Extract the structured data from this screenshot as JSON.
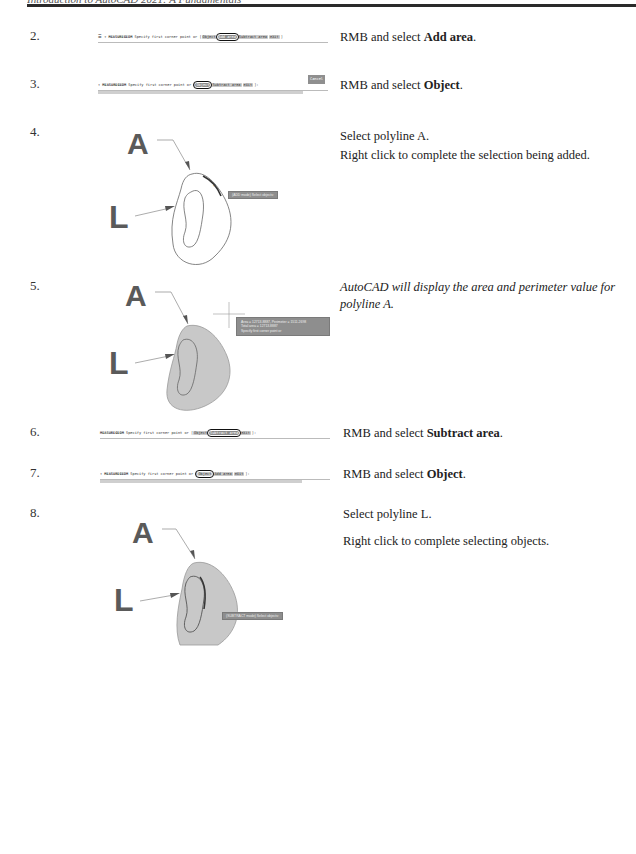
{
  "header": {
    "title": "Introduction to AutoCAD 2021: A Fundamentals"
  },
  "steps": [
    {
      "number": "2.",
      "command": {
        "prefix": "☰ ▾",
        "keyword": "MEASUREGEOM",
        "prompt": "Specify first corner point or [",
        "options": [
          "Object",
          "Add area",
          "Subtract area",
          "eXit"
        ],
        "suffix": "]",
        "boxed_option": "Add area"
      },
      "instruction_pre": "RMB and select ",
      "instruction_bold": "Add area",
      "instruction_post": "."
    },
    {
      "number": "3.",
      "command": {
        "prefix": "▾",
        "keyword": "MEASUREGEOM",
        "prompt": "Specify first corner point or [",
        "options": [
          "Object",
          "Subtract area",
          "eXit"
        ],
        "suffix": "]:",
        "boxed_option": "Object",
        "badge": "Cancel"
      },
      "instruction_pre": "RMB and select ",
      "instruction_bold": "Object",
      "instruction_post": "."
    },
    {
      "number": "4.",
      "figure": {
        "label_a": "A",
        "label_l": "L",
        "tooltip": "(ADD mode) Select objects:",
        "fill": false
      },
      "lines": [
        "Select polyline A.",
        "Right click to complete the selection being added."
      ]
    },
    {
      "number": "5.",
      "figure": {
        "label_a": "A",
        "label_l": "L",
        "tooltip_lines": [
          "Area = 12713.8887, Perimeter = 1511.2698",
          "Total area = 12713.8887",
          "Specify first corner point or"
        ],
        "fill": true
      },
      "lines": [
        "AutoCAD will display the area and perimeter value for polyline A."
      ]
    },
    {
      "number": "6.",
      "command": {
        "prefix": "",
        "keyword": "MEASUREGEOM",
        "prompt": "Specify first corner point or [",
        "options": [
          "Object",
          "Subtract area",
          "eXit"
        ],
        "suffix": "]:",
        "boxed_option": "Subtract area"
      },
      "instruction_pre": "RMB and select ",
      "instruction_bold": "Subtract area",
      "instruction_post": "."
    },
    {
      "number": "7.",
      "command": {
        "prefix": "▾",
        "keyword": "MEASUREGEOM",
        "prompt": "Specify first corner point or [",
        "options": [
          "Object",
          "Add area",
          "eXit"
        ],
        "suffix": "]:",
        "boxed_option": "Object"
      },
      "instruction_pre": "RMB and select ",
      "instruction_bold": "Object",
      "instruction_post": "."
    },
    {
      "number": "8.",
      "figure": {
        "label_a": "A",
        "label_l": "L",
        "tooltip": "(SUBTRACT mode) Select objects:",
        "fill": true
      },
      "lines": [
        "Select polyline L.",
        "Right click to complete selecting objects."
      ]
    }
  ]
}
